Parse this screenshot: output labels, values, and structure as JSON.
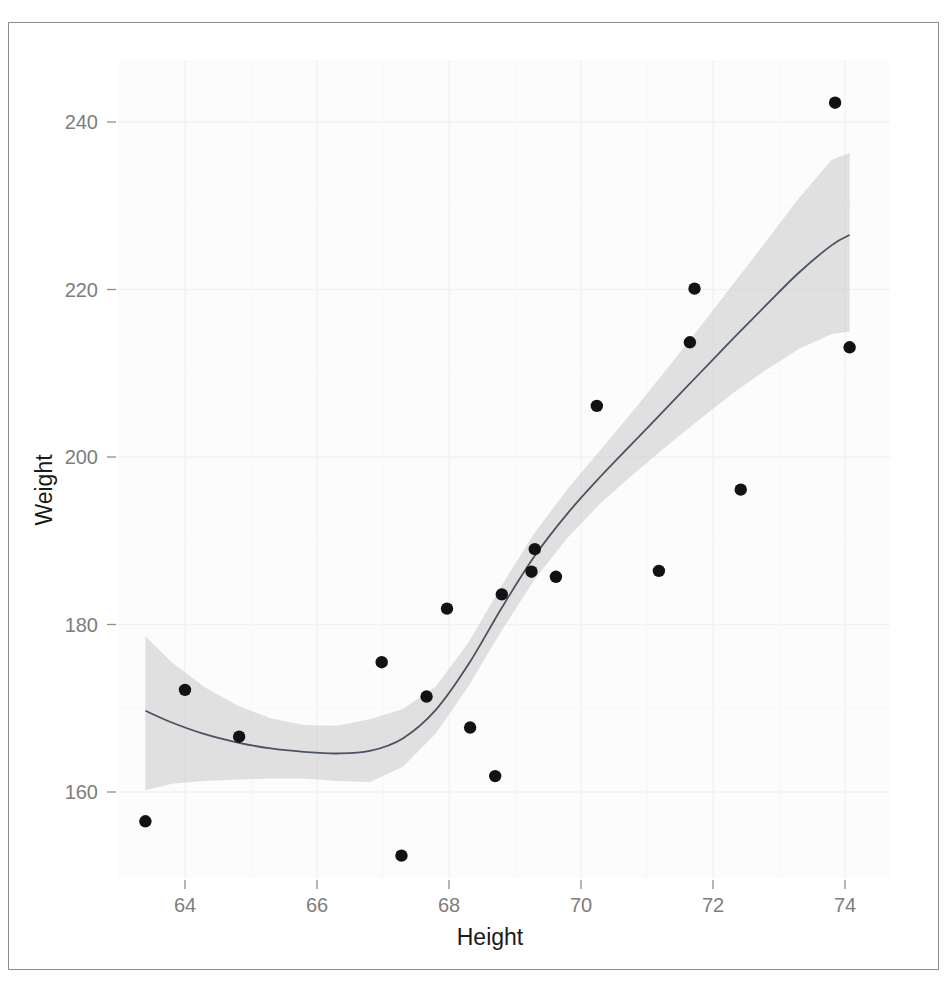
{
  "chart_data": {
    "type": "scatter",
    "title": "",
    "xlabel": "Height",
    "ylabel": "Weight",
    "xlim": [
      63.0,
      74.5
    ],
    "ylim": [
      148.0,
      246.0
    ],
    "xticks": [
      64,
      66,
      68,
      70,
      72,
      74
    ],
    "yticks": [
      160,
      180,
      200,
      220,
      240
    ],
    "xtick_labels": [
      "64",
      "66",
      "68",
      "70",
      "72",
      "74"
    ],
    "ytick_labels": [
      "160",
      "180",
      "200",
      "220",
      "240"
    ],
    "grid": true,
    "legend": "none",
    "points": [
      {
        "x": 63.4,
        "y": 156.5
      },
      {
        "x": 64.0,
        "y": 172.2
      },
      {
        "x": 64.82,
        "y": 166.6
      },
      {
        "x": 66.98,
        "y": 175.5
      },
      {
        "x": 67.28,
        "y": 152.4
      },
      {
        "x": 67.66,
        "y": 171.4
      },
      {
        "x": 67.97,
        "y": 181.9
      },
      {
        "x": 68.32,
        "y": 167.7
      },
      {
        "x": 68.7,
        "y": 161.9
      },
      {
        "x": 68.8,
        "y": 183.6
      },
      {
        "x": 69.25,
        "y": 186.3
      },
      {
        "x": 69.3,
        "y": 189.0
      },
      {
        "x": 69.62,
        "y": 185.7
      },
      {
        "x": 70.24,
        "y": 206.1
      },
      {
        "x": 71.18,
        "y": 186.4
      },
      {
        "x": 71.65,
        "y": 213.7
      },
      {
        "x": 71.72,
        "y": 220.1
      },
      {
        "x": 72.42,
        "y": 196.1
      },
      {
        "x": 73.85,
        "y": 242.3
      },
      {
        "x": 74.07,
        "y": 213.1
      }
    ],
    "smooth": {
      "name": "loess-smooth",
      "x": [
        63.4,
        63.8,
        64.3,
        64.8,
        65.3,
        65.8,
        66.3,
        66.8,
        67.3,
        67.8,
        68.3,
        68.8,
        69.3,
        69.8,
        70.3,
        70.8,
        71.3,
        71.8,
        72.3,
        72.8,
        73.3,
        73.8,
        74.07
      ],
      "y": [
        169.7,
        168.3,
        166.9,
        165.9,
        165.2,
        164.8,
        164.6,
        164.9,
        166.4,
        169.8,
        175.3,
        182.0,
        188.2,
        193.3,
        197.7,
        201.8,
        205.9,
        210.0,
        214.1,
        218.1,
        222.0,
        225.3,
        226.5
      ],
      "ci_low": [
        160.2,
        161.0,
        161.3,
        161.5,
        161.6,
        161.6,
        161.3,
        161.2,
        163.0,
        167.0,
        172.7,
        179.3,
        185.4,
        190.4,
        194.5,
        198.0,
        201.3,
        204.5,
        207.6,
        210.4,
        212.9,
        214.7,
        215.0
      ],
      "ci_high": [
        178.6,
        175.5,
        172.5,
        170.3,
        168.8,
        168.0,
        167.9,
        168.7,
        169.9,
        172.6,
        177.9,
        184.7,
        191.0,
        196.2,
        200.9,
        205.6,
        210.5,
        215.5,
        220.6,
        225.7,
        230.9,
        235.5,
        236.3
      ]
    },
    "style": {
      "point_color": "#121212",
      "line_color": "#4a5362",
      "ribbon_color": "#cfcfcf",
      "panel_background": "#fcfcfc",
      "grid_color": "#f2f2f2",
      "tick_label_color": "#7d7d7d",
      "axis_title_color": "#1a1a1a"
    }
  }
}
